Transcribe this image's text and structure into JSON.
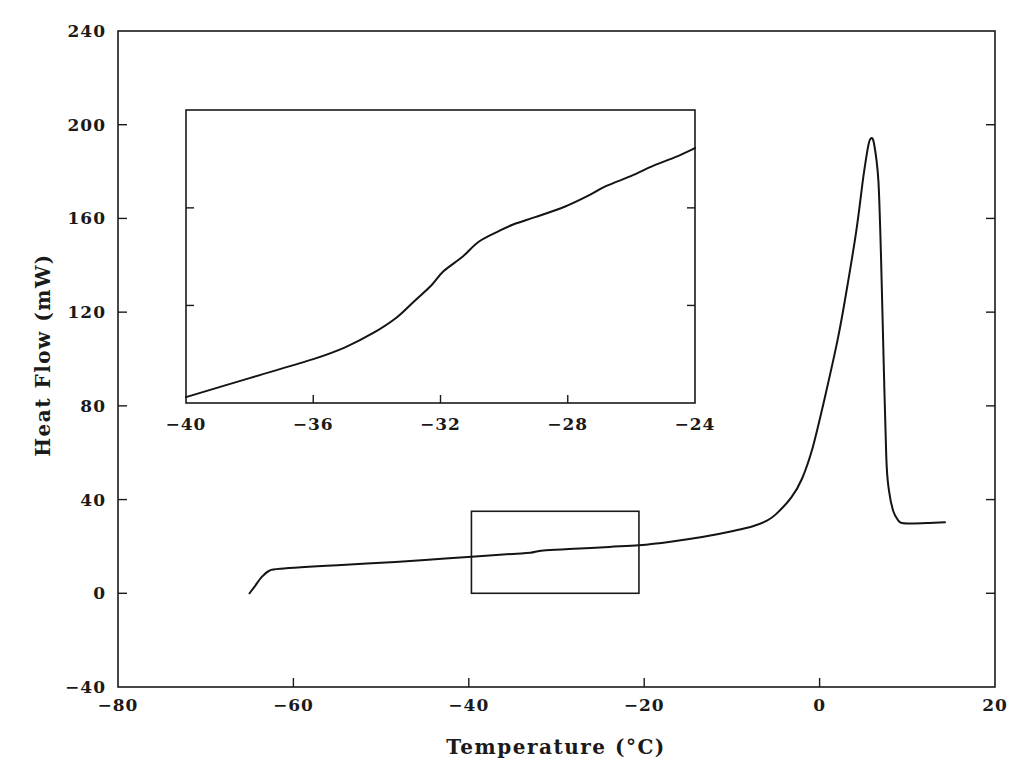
{
  "chart_data": [
    {
      "id": "main",
      "type": "line",
      "title": "",
      "xlabel": "Temperature (°C)",
      "ylabel": "Heat Flow (mW)",
      "xlim": [
        -80,
        20
      ],
      "ylim": [
        -40,
        240
      ],
      "xticks": [
        -80,
        -60,
        -40,
        -20,
        0,
        20
      ],
      "xtick_labels": [
        "-80",
        "-60",
        "-40",
        "-20",
        "0",
        "20"
      ],
      "yticks": [
        -40,
        0,
        40,
        80,
        120,
        160,
        200,
        240
      ],
      "ytick_labels": [
        "-40",
        "0",
        "40",
        "80",
        "120",
        "160",
        "200",
        "240"
      ],
      "grid": false,
      "legend": null,
      "series": [
        {
          "name": "DSC heat flow",
          "x": [
            -65.0,
            -64.4,
            -63.6,
            -62.8,
            -61.5,
            -55,
            -50,
            -45,
            -39.7,
            -35,
            -33,
            -31.5,
            -28,
            -24,
            -20.6,
            -17,
            -13.4,
            -10,
            -7.7,
            -6,
            -4.9,
            -3.2,
            -2,
            -0.8,
            0.5,
            2.1,
            3.2,
            4.2,
            5.0,
            5.5,
            5.8,
            6.2,
            6.7,
            7.0,
            7.3,
            7.6,
            7.9,
            8.4,
            9.0,
            9.4,
            10.5,
            12.5,
            14.3
          ],
          "y": [
            0,
            3,
            7,
            9.5,
            10.5,
            12,
            13,
            14.2,
            15.6,
            16.8,
            17.3,
            18.3,
            19.0,
            19.8,
            20.5,
            22,
            24,
            26.5,
            28.5,
            31,
            34,
            41,
            49,
            62,
            82,
            109,
            132,
            155,
            178,
            190,
            194,
            192,
            176,
            144,
            100,
            58,
            44,
            35,
            31,
            30,
            29.8,
            30,
            30.3
          ]
        }
      ],
      "annotations": [
        {
          "type": "zoom-rectangle",
          "x_range": [
            -39.7,
            -20.6
          ],
          "y_range": [
            0,
            35
          ],
          "note": "region magnified in inset"
        }
      ]
    },
    {
      "id": "inset",
      "type": "line",
      "title": "",
      "xlabel": "",
      "ylabel": "",
      "xlim": [
        -40,
        -24
      ],
      "ylim_relative": [
        0,
        100
      ],
      "xticks": [
        -40,
        -36,
        -32,
        -28,
        -24
      ],
      "xtick_labels": [
        "-40",
        "-36",
        "-32",
        "-28",
        "-24"
      ],
      "yticks_relative": [
        33.3,
        66.6
      ],
      "ytick_labels": [],
      "grid": false,
      "series": [
        {
          "name": "DSC heat flow (magnified glass transition)",
          "x": [
            -40,
            -38,
            -36,
            -35,
            -34.1,
            -33.4,
            -32.8,
            -32.3,
            -31.9,
            -31.3,
            -30.8,
            -30.2,
            -29.7,
            -29.0,
            -28.1,
            -27.4,
            -26.8,
            -26.0,
            -25.3,
            -24.6,
            -24
          ],
          "y": [
            2,
            8.5,
            15,
            19,
            24,
            29,
            35,
            40,
            45,
            50,
            55,
            58.5,
            61,
            63.5,
            67,
            70.5,
            74,
            77.5,
            81,
            84,
            87
          ]
        }
      ]
    }
  ],
  "layout": {
    "main_frame_px": {
      "left": 118,
      "top": 31,
      "right": 995,
      "bottom": 687
    },
    "inset_frame_px": {
      "left": 186,
      "top": 110,
      "right": 695,
      "bottom": 403
    }
  }
}
